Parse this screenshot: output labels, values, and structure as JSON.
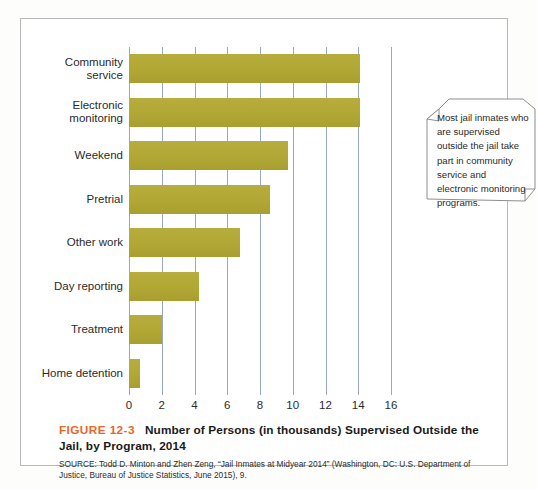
{
  "figure": {
    "number": "FIGURE 12-3",
    "title": "Number of Persons (in thousands) Supervised Outside the Jail, by Program, 2014",
    "source": "SOURCE: Todd D. Minton and Zhen Zeng, “Jail Inmates at Midyear 2014” (Washington, DC: U.S. Department of Justice, Bureau of Justice Statistics, June 2015), 9."
  },
  "callout": {
    "text": "Most jail inmates who are supervised outside the jail take part in community service and electronic monitoring programs."
  },
  "colors": {
    "bar": "#b3a93a",
    "gridline": "#9aa7c4",
    "figure_number": "#e8662a",
    "frame": "#b9b9b9"
  },
  "chart_data": {
    "type": "bar",
    "orientation": "horizontal",
    "title": "Number of Persons (in thousands) Supervised Outside the Jail, by Program, 2014",
    "xlabel": "",
    "ylabel": "",
    "xlim": [
      0,
      16
    ],
    "xticks": [
      0,
      2,
      4,
      6,
      8,
      10,
      12,
      14,
      16
    ],
    "grid": true,
    "legend": "none",
    "categories": [
      "Community\nservice",
      "Electronic\nmonitoring",
      "Weekend",
      "Pretrial",
      "Other work",
      "Day reporting",
      "Treatment",
      "Home detention"
    ],
    "values": [
      14.1,
      14.1,
      9.7,
      8.6,
      6.8,
      4.3,
      2.0,
      0.7
    ]
  }
}
